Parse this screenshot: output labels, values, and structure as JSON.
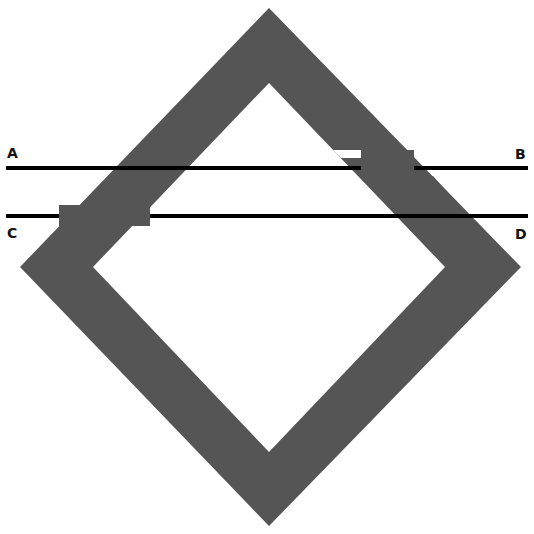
{
  "diagram": {
    "labels": {
      "a": "A",
      "b": "B",
      "c": "C",
      "d": "D"
    },
    "lines": [
      {
        "name": "line-ab",
        "from": "A",
        "to": "B"
      },
      {
        "name": "line-cd",
        "from": "C",
        "to": "D"
      }
    ],
    "colors": {
      "shape": "#555555",
      "lines": "#000000",
      "background": "#ffffff"
    }
  }
}
